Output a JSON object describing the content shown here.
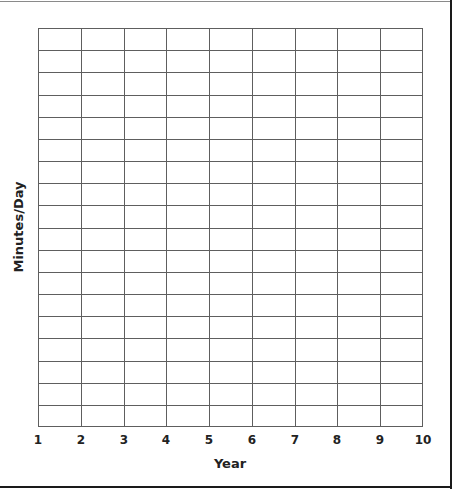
{
  "chart_data": {
    "type": "line",
    "title": "",
    "xlabel": "Year",
    "ylabel": "Minutes/Day",
    "x_ticks": [
      "1",
      "2",
      "3",
      "4",
      "5",
      "6",
      "7",
      "8",
      "9",
      "10"
    ],
    "y_ticks": [],
    "x_range": [
      1,
      10
    ],
    "grid": true,
    "grid_columns": 9,
    "grid_rows": 18,
    "series": [],
    "legend": null
  },
  "colors": {
    "gridline": "#5e5e5e",
    "frame": "#1a1a1a",
    "text": "#222222"
  }
}
